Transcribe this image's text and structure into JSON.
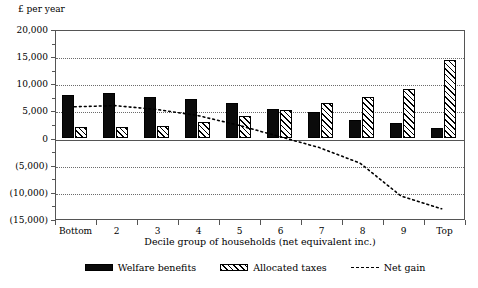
{
  "chart_data": {
    "type": "bar",
    "title": "",
    "unit_caption": "£ per year",
    "xlabel": "Decile group of households (net equivalent inc.)",
    "ylabel": "",
    "categories": [
      "Bottom",
      "2",
      "3",
      "4",
      "5",
      "6",
      "7",
      "8",
      "9",
      "Top"
    ],
    "ylim": [
      -15000,
      20000
    ],
    "ytick_labels": [
      "20,000",
      "15,000",
      "10,000",
      "5,000",
      "0",
      "(5,000)",
      "(10,000)",
      "(15,000)"
    ],
    "ytick_values": [
      20000,
      15000,
      10000,
      5000,
      0,
      -5000,
      -10000,
      -15000
    ],
    "grid": true,
    "legend_position": "bottom",
    "series": [
      {
        "name": "Welfare benefits",
        "style": "solid-black-bar",
        "values": [
          7900,
          8200,
          7500,
          7100,
          6400,
          5300,
          4700,
          3300,
          2700,
          1800
        ]
      },
      {
        "name": "Allocated taxes",
        "style": "hatched-bar",
        "values": [
          2000,
          1900,
          2100,
          2900,
          3900,
          5100,
          6400,
          7400,
          9000,
          14300
        ]
      },
      {
        "name": "Net gain",
        "style": "dotted-line",
        "values": [
          5900,
          6100,
          5400,
          4300,
          2500,
          400,
          -1700,
          -4600,
          -10700,
          -13100
        ]
      }
    ]
  },
  "legend": {
    "items": [
      {
        "label": "Welfare benefits",
        "swatch": "solid-black-swatch"
      },
      {
        "label": "Allocated taxes",
        "swatch": "hatched-swatch"
      },
      {
        "label": "Net gain",
        "swatch": "dotted-line-swatch"
      }
    ]
  }
}
